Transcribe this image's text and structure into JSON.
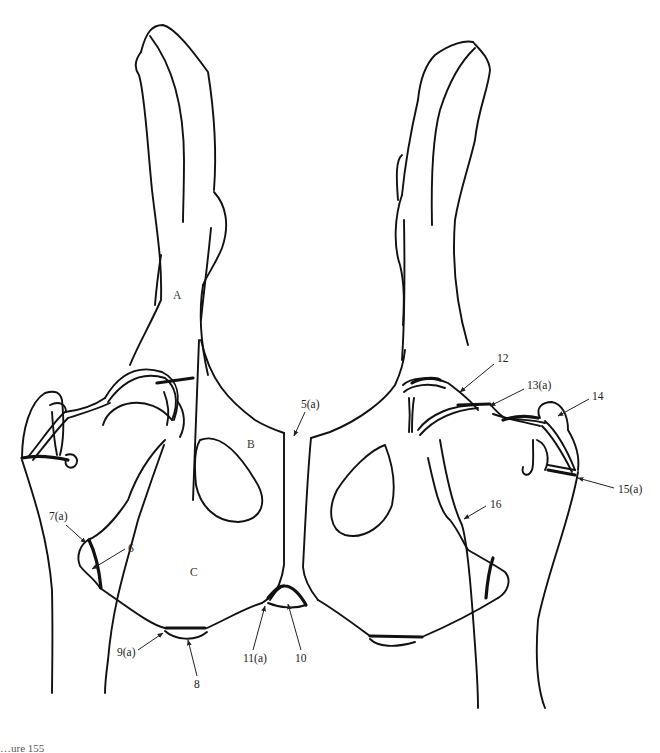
{
  "figure": {
    "type": "anatomical line drawing",
    "caption_partial": "…ure 155",
    "regions": {
      "A": "A",
      "B": "B",
      "C": "C"
    },
    "labels": {
      "l5a": "5(a)",
      "l6": "6",
      "l7a": "7(a)",
      "l8": "8",
      "l9a": "9(a)",
      "l10": "10",
      "l11a": "11(a)",
      "l12": "12",
      "l13a": "13(a)",
      "l14": "14",
      "l15a": "15(a)",
      "l16": "16"
    },
    "colors": {
      "line": "#111111",
      "background": "#ffffff"
    }
  }
}
